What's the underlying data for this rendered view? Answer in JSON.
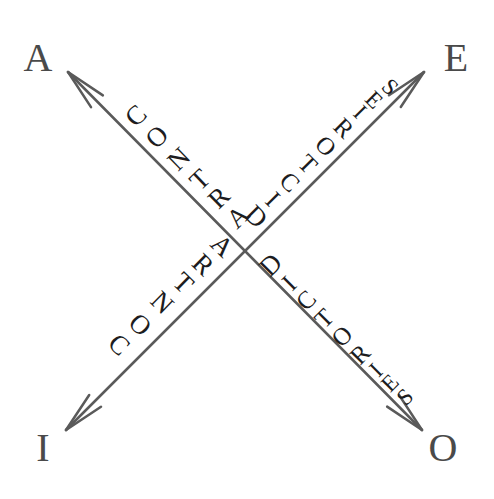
{
  "canvas": {
    "width": 494,
    "height": 499,
    "background": "#ffffff"
  },
  "style": {
    "line_color": "#5a5a5a",
    "line_width": 2.5,
    "corner_label_color": "#4a4a4a",
    "glyph_color": "#1c1c20",
    "corner_label_size": 40
  },
  "diagram": {
    "type": "square-of-opposition-contradictories",
    "center": {
      "x": 243,
      "y": 252
    }
  },
  "corners": [
    {
      "id": "corner-a",
      "label": "A",
      "x": 38,
      "y": 58,
      "position": "top-left"
    },
    {
      "id": "corner-e",
      "label": "E",
      "x": 456,
      "y": 58,
      "position": "top-right"
    },
    {
      "id": "corner-i",
      "label": "I",
      "x": 43,
      "y": 448,
      "position": "bottom-left"
    },
    {
      "id": "corner-o",
      "label": "O",
      "x": 443,
      "y": 448,
      "position": "bottom-right"
    }
  ],
  "arrows": [
    {
      "id": "arrow-a-o",
      "name": "contradictories-arrow-a-o",
      "from": "A",
      "to": "O",
      "relation": "CONTRADICTORIES",
      "x1": 68,
      "y1": 72,
      "x2": 422,
      "y2": 430,
      "double_headed": true
    },
    {
      "id": "arrow-e-i",
      "name": "contradictories-arrow-e-i",
      "from": "E",
      "to": "I",
      "relation": "CONTRADICTORIES",
      "x1": 424,
      "y1": 72,
      "x2": 66,
      "y2": 430,
      "double_headed": true
    }
  ],
  "labels": [
    {
      "id": "label-contra-upper-left",
      "name": "relation-label-contra-upper-left",
      "word": "CONTRA",
      "segment": "outer",
      "arrow": "arrow-e-i",
      "glyphs": [
        {
          "ch": "C",
          "x": 136,
          "y": 116,
          "rot": -44,
          "size": 27
        },
        {
          "ch": "O",
          "x": 157,
          "y": 137,
          "rot": -44,
          "size": 27
        },
        {
          "ch": "N",
          "x": 179,
          "y": 159,
          "rot": -44,
          "size": 27
        },
        {
          "ch": "T",
          "x": 200,
          "y": 180,
          "rot": -44,
          "size": 27
        },
        {
          "ch": "R",
          "x": 219,
          "y": 198,
          "rot": -44,
          "size": 27
        },
        {
          "ch": "A",
          "x": 238,
          "y": 217,
          "rot": -44,
          "size": 27
        }
      ]
    },
    {
      "id": "label-dictories-upper-right",
      "name": "relation-label-dictories-upper-right",
      "word": "DICTORIES",
      "segment": "inner",
      "arrow": "arrow-a-o",
      "glyphs": [
        {
          "ch": "D",
          "x": 256,
          "y": 217,
          "rot": 45,
          "size": 27
        },
        {
          "ch": "I",
          "x": 273,
          "y": 199,
          "rot": 45,
          "size": 25
        },
        {
          "ch": "C",
          "x": 290,
          "y": 182,
          "rot": 45,
          "size": 25
        },
        {
          "ch": "T",
          "x": 308,
          "y": 164,
          "rot": 45,
          "size": 25
        },
        {
          "ch": "O",
          "x": 326,
          "y": 146,
          "rot": 45,
          "size": 25
        },
        {
          "ch": "R",
          "x": 344,
          "y": 128,
          "rot": 45,
          "size": 25
        },
        {
          "ch": "I",
          "x": 360,
          "y": 112,
          "rot": 45,
          "size": 23
        },
        {
          "ch": "E",
          "x": 374,
          "y": 100,
          "rot": 45,
          "size": 23
        },
        {
          "ch": "S",
          "x": 390,
          "y": 87,
          "rot": 45,
          "size": 23
        }
      ]
    },
    {
      "id": "label-contra-lower-left",
      "name": "relation-label-contra-lower-left",
      "word": "CONTRA",
      "segment": "outer",
      "arrow": "arrow-a-o",
      "glyphs": [
        {
          "ch": "C",
          "x": 119,
          "y": 345,
          "rot": 44,
          "size": 27
        },
        {
          "ch": "O",
          "x": 140,
          "y": 325,
          "rot": 44,
          "size": 27
        },
        {
          "ch": "N",
          "x": 162,
          "y": 303,
          "rot": 44,
          "size": 27
        },
        {
          "ch": "T",
          "x": 183,
          "y": 283,
          "rot": 44,
          "size": 27
        },
        {
          "ch": "R",
          "x": 203,
          "y": 265,
          "rot": 44,
          "size": 27
        },
        {
          "ch": "A",
          "x": 222,
          "y": 246,
          "rot": 44,
          "size": 27
        }
      ]
    },
    {
      "id": "label-dictories-lower-right",
      "name": "relation-label-dictories-lower-right",
      "word": "DICTORIES",
      "segment": "inner",
      "arrow": "arrow-e-i",
      "glyphs": [
        {
          "ch": "D",
          "x": 271,
          "y": 265,
          "rot": -45,
          "size": 27
        },
        {
          "ch": "I",
          "x": 289,
          "y": 283,
          "rot": -45,
          "size": 25
        },
        {
          "ch": "C",
          "x": 306,
          "y": 300,
          "rot": -45,
          "size": 25
        },
        {
          "ch": "T",
          "x": 324,
          "y": 318,
          "rot": -45,
          "size": 25
        },
        {
          "ch": "O",
          "x": 342,
          "y": 336,
          "rot": -45,
          "size": 25
        },
        {
          "ch": "R",
          "x": 360,
          "y": 354,
          "rot": -45,
          "size": 25
        },
        {
          "ch": "I",
          "x": 376,
          "y": 370,
          "rot": -45,
          "size": 23
        },
        {
          "ch": "E",
          "x": 390,
          "y": 383,
          "rot": -45,
          "size": 23
        },
        {
          "ch": "S",
          "x": 405,
          "y": 397,
          "rot": -45,
          "size": 23
        }
      ]
    }
  ]
}
